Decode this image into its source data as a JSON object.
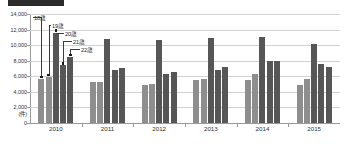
{
  "chart_data": {
    "type": "bar",
    "title": "",
    "xlabel": "",
    "ylabel": "(件)",
    "ylim": [
      0,
      14000
    ],
    "ytick_step": 2000,
    "grid": true,
    "legend_position": "inline-callouts",
    "categories": [
      "2010",
      "2011",
      "2012",
      "2013",
      "2014",
      "2015"
    ],
    "series": [
      {
        "name": "18歳",
        "color": "#8e8e8e",
        "values": [
          5650,
          5250,
          4850,
          5550,
          5550,
          4900
        ]
      },
      {
        "name": "19歳",
        "color": "#8e8e8e",
        "values": [
          5900,
          5300,
          5000,
          5700,
          6250,
          5700
        ]
      },
      {
        "name": "20歳",
        "color": "#565656",
        "values": [
          11600,
          10750,
          10600,
          10950,
          11050,
          10150
        ]
      },
      {
        "name": "21歳",
        "color": "#565656",
        "values": [
          7400,
          6800,
          6250,
          6800,
          7950,
          7550
        ]
      },
      {
        "name": "22歳",
        "color": "#565656",
        "values": [
          8500,
          7100,
          6600,
          7150,
          7950,
          7250
        ]
      }
    ],
    "ytick_labels": [
      "14,000",
      "12,000",
      "10,000",
      "8,000",
      "6,000",
      "4,000",
      "2,000",
      "0"
    ],
    "ytick_values": [
      14000,
      12000,
      10000,
      8000,
      6000,
      4000,
      2000,
      0
    ],
    "annotations": [
      {
        "label": "18歳",
        "series": "18歳",
        "category": "2010"
      },
      {
        "label": "19歳",
        "series": "19歳",
        "category": "2010"
      },
      {
        "label": "20歳",
        "series": "20歳",
        "category": "2010"
      },
      {
        "label": "21歳",
        "series": "21歳",
        "category": "2010"
      },
      {
        "label": "22歳",
        "series": "22歳",
        "category": "2010"
      }
    ]
  }
}
